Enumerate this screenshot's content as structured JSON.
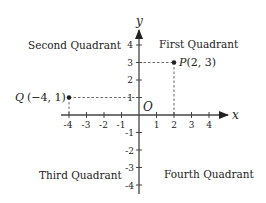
{
  "diagram": {
    "axes": {
      "x_label": "x",
      "y_label": "y",
      "origin_label": "O"
    },
    "x_ticks": [
      "-4",
      "-3",
      "-2",
      "-1",
      "1",
      "2",
      "3",
      "4"
    ],
    "y_ticks": [
      "4",
      "3",
      "2",
      "1",
      "-1",
      "-2",
      "-3",
      "-4"
    ],
    "quadrants": {
      "first": "First Quadrant",
      "second": "Second Quadrant",
      "third": "Third Quadrant",
      "fourth": "Fourth Quadrant"
    },
    "points": [
      {
        "name": "P",
        "coords": "(2, 3)",
        "x": 2,
        "y": 3
      },
      {
        "name": "Q",
        "coords": "(−4, 1)",
        "x": -4,
        "y": 1
      }
    ],
    "colors": {
      "ink": "#222222",
      "background": "#ffffff"
    }
  }
}
